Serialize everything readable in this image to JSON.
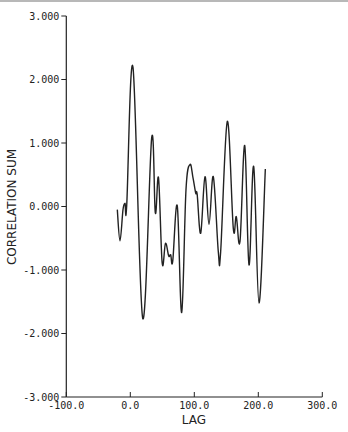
{
  "chart_data": {
    "type": "line",
    "title": "",
    "xlabel": "LAG",
    "ylabel": "CORRELATION SUM",
    "xlim": [
      -100,
      300
    ],
    "ylim": [
      -3,
      3
    ],
    "grid": false,
    "legend": null,
    "x_ticks": [
      -100,
      0,
      100,
      200,
      300
    ],
    "x_tick_labels": [
      "-100.0",
      "0.0",
      "100.0",
      "200.0",
      "300.0"
    ],
    "y_ticks": [
      3,
      2,
      1,
      0,
      -1,
      -2,
      -3
    ],
    "y_tick_labels": [
      "3.000",
      "2.000",
      "1.000",
      "0.000",
      "-1.000",
      "-2.000",
      "-3.000"
    ],
    "series": [
      {
        "name": "correlation sum",
        "color": "#222222",
        "x": [
          -20.3,
          -16.1,
          -11.4,
          -8.3,
          -5.6,
          4.2,
          19.4,
          33.4,
          39.1,
          44.1,
          49.8,
          55.0,
          60.0,
          63.1,
          66.3,
          73.4,
          80.3,
          87.0,
          93.3,
          98.0,
          102.2,
          104.5,
          110.0,
          116.7,
          123.0,
          129.7,
          137.5,
          141.2,
          151.6,
          160.9,
          165.6,
          171.4,
          178.8,
          185.5,
          192.8,
          201.1,
          211.0
        ],
        "y": [
          -0.05,
          -0.54,
          -0.05,
          0.05,
          0.02,
          2.19,
          -1.76,
          1.08,
          -0.1,
          0.45,
          -0.89,
          -0.58,
          -0.78,
          -0.76,
          -0.86,
          0.01,
          -1.67,
          0.26,
          0.66,
          0.45,
          0.21,
          0.19,
          -0.42,
          0.47,
          -0.28,
          0.47,
          -0.71,
          -0.71,
          1.34,
          -0.34,
          -0.16,
          -0.55,
          0.96,
          -0.92,
          0.63,
          -1.52,
          0.59
        ]
      }
    ]
  }
}
